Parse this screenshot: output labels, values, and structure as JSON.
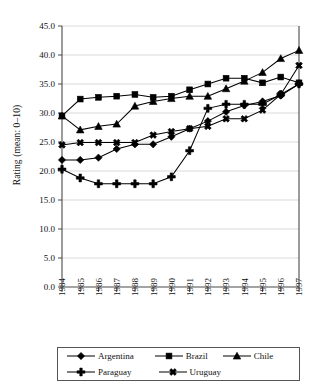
{
  "chart_data": {
    "type": "line",
    "title": "",
    "xlabel": "",
    "ylabel": "Rating (mean: 0–10)",
    "x": [
      1984,
      1985,
      1986,
      1987,
      1988,
      1989,
      1990,
      1991,
      1992,
      1993,
      1994,
      1995,
      1996,
      1997
    ],
    "categories": [
      "1984",
      "1985",
      "1986",
      "1987",
      "1988",
      "1989",
      "1990",
      "1991",
      "1992",
      "1993",
      "1994",
      "1995",
      "1996",
      "1997"
    ],
    "xlim": [
      1984,
      1997
    ],
    "ylim": [
      0.0,
      45.0
    ],
    "yticks": [
      "0.0",
      "5.0",
      "10.0",
      "15.0",
      "20.0",
      "25.0",
      "30.0",
      "35.0",
      "40.0",
      "45.0"
    ],
    "ytick_values": [
      0.0,
      5.0,
      10.0,
      15.0,
      20.0,
      25.0,
      30.0,
      35.0,
      40.0,
      45.0
    ],
    "grid": true,
    "legend_position": "bottom",
    "series": [
      {
        "name": "Argentina",
        "marker": "diamond",
        "values": [
          21.9,
          21.9,
          22.3,
          23.8,
          24.6,
          24.6,
          25.9,
          27.3,
          28.6,
          30.2,
          31.3,
          32.0,
          33.0,
          35.0
        ]
      },
      {
        "name": "Brazil",
        "marker": "square",
        "values": [
          29.5,
          32.4,
          32.7,
          32.9,
          33.2,
          32.7,
          32.9,
          34.0,
          35.0,
          36.0,
          36.0,
          35.2,
          36.2,
          35.2
        ]
      },
      {
        "name": "Chile",
        "marker": "triangle",
        "values": [
          29.5,
          27.1,
          27.7,
          28.1,
          31.2,
          32.0,
          32.5,
          32.9,
          32.9,
          34.2,
          35.5,
          37.0,
          39.4,
          40.8
        ]
      },
      {
        "name": "Paraguay",
        "marker": "plus",
        "values": [
          20.3,
          18.8,
          17.8,
          17.8,
          17.8,
          17.8,
          19.0,
          23.5,
          30.8,
          31.5,
          31.5,
          31.5,
          33.2,
          35.0
        ]
      },
      {
        "name": "Uruguay",
        "marker": "cross",
        "values": [
          24.5,
          24.9,
          24.9,
          24.9,
          24.9,
          26.2,
          26.8,
          27.3,
          27.7,
          29.0,
          29.0,
          30.5,
          33.2,
          38.2
        ]
      }
    ]
  },
  "legend": {
    "entries": [
      {
        "label": "Argentina",
        "marker": "diamond"
      },
      {
        "label": "Brazil",
        "marker": "square"
      },
      {
        "label": "Chile",
        "marker": "triangle"
      },
      {
        "label": "Paraguay",
        "marker": "plus"
      },
      {
        "label": "Uruguay",
        "marker": "cross"
      }
    ]
  }
}
